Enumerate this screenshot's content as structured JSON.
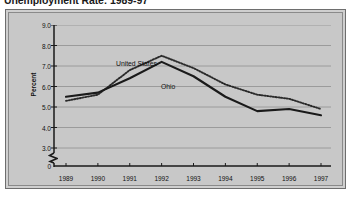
{
  "figure": {
    "title": "Unemployment Rate: 1989-97"
  },
  "axis": {
    "ylabel": "Percent",
    "yticks": [
      "9.0",
      "8.0",
      "7.0",
      "6.0",
      "5.0",
      "4.0",
      "3.0",
      "0"
    ],
    "xticks": [
      "1989",
      "1990",
      "1991",
      "1992",
      "1993",
      "1994",
      "1995",
      "1996",
      "1997"
    ],
    "break_symbol": "axis-break-zigzag"
  },
  "annotations": {
    "united_states": "United States",
    "ohio": "Ohio"
  },
  "colors": {
    "panel_background": "#c8c8c8",
    "panel_border": "#6e6e6e",
    "gridline": "#8f8f8f",
    "axis": "#1a1a1a",
    "series_ohio": "#1a1a1a",
    "series_united_states": "#2a2a2a",
    "page_background": "#ffffff"
  },
  "chart_data": {
    "type": "line",
    "title": "Unemployment Rate: 1989-97",
    "xlabel": "",
    "ylabel": "Percent",
    "categories": [
      "1989",
      "1990",
      "1991",
      "1992",
      "1993",
      "1994",
      "1995",
      "1996",
      "1997"
    ],
    "ylim": [
      3.0,
      9.0
    ],
    "yticks": [
      3.0,
      4.0,
      5.0,
      6.0,
      7.0,
      8.0,
      9.0
    ],
    "y_axis_break": true,
    "y_axis_break_between": [
      0,
      3.0
    ],
    "grid": true,
    "legend": "inline-annotations",
    "series": [
      {
        "name": "United States",
        "style": "dotted",
        "values": [
          5.3,
          5.6,
          6.8,
          7.5,
          6.9,
          6.1,
          5.6,
          5.4,
          4.9
        ]
      },
      {
        "name": "Ohio",
        "style": "solid",
        "values": [
          5.5,
          5.7,
          6.4,
          7.2,
          6.5,
          5.5,
          4.8,
          4.9,
          4.6
        ]
      }
    ]
  }
}
